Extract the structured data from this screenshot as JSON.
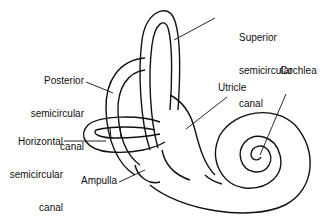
{
  "diagram": {
    "labels": {
      "superior": {
        "line1": "Superior",
        "line2": "semicircular",
        "line3": "canal"
      },
      "posterior": {
        "line1": "Posterior",
        "line2": "semicircular",
        "line3": "canal"
      },
      "horizontal": {
        "line1": "Horizontal",
        "line2": "semicircular",
        "line3": "canal"
      },
      "utricle": "Utricle",
      "cochlea": "Cochlea",
      "ampulla": "Ampulla"
    },
    "colors": {
      "line": "#111111",
      "background": "#ffffff"
    }
  }
}
